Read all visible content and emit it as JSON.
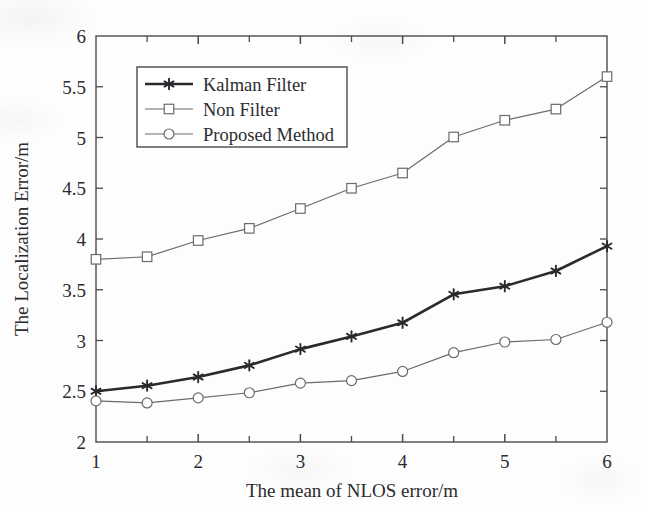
{
  "chart_data": {
    "type": "line",
    "title": "",
    "xlabel": "The mean of NLOS error/m",
    "ylabel": "The Localization Error/m",
    "x": [
      1,
      1.5,
      2,
      2.5,
      3,
      3.5,
      4,
      4.5,
      5,
      5.5,
      6
    ],
    "xlim": [
      1,
      6
    ],
    "ylim": [
      2,
      6
    ],
    "xticks": [
      1,
      2,
      3,
      4,
      5,
      6
    ],
    "xtick_labels": [
      "1",
      "2",
      "3",
      "4",
      "5",
      "6"
    ],
    "xminorticks": [
      1.5,
      2.5,
      3.5,
      4.5,
      5.5
    ],
    "yticks": [
      2,
      2.5,
      3,
      3.5,
      4,
      4.5,
      5,
      5.5,
      6
    ],
    "ytick_labels": [
      "2",
      "2.5",
      "3",
      "3.5",
      "4",
      "4.5",
      "5",
      "5.5",
      "6"
    ],
    "grid": false,
    "legend_position": "upper left",
    "series": [
      {
        "name": "Kalman Filter",
        "marker": "star",
        "color": "#2a2a2e",
        "linewidth": 2.6,
        "values": [
          2.5,
          2.555,
          2.64,
          2.755,
          2.915,
          3.04,
          3.175,
          3.455,
          3.535,
          3.685,
          3.93
        ]
      },
      {
        "name": "Non Filter",
        "marker": "square",
        "color": "#6a6a70",
        "linewidth": 1.2,
        "values": [
          3.8,
          3.825,
          3.985,
          4.105,
          4.3,
          4.5,
          4.65,
          5.005,
          5.17,
          5.28,
          5.6
        ]
      },
      {
        "name": "Proposed Method",
        "marker": "circle",
        "color": "#6a6a70",
        "linewidth": 1.2,
        "values": [
          2.405,
          2.385,
          2.435,
          2.485,
          2.58,
          2.605,
          2.695,
          2.88,
          2.985,
          3.01,
          3.18
        ]
      }
    ]
  },
  "legend": {
    "entries": [
      {
        "label": "Kalman Filter"
      },
      {
        "label": "Non Filter"
      },
      {
        "label": "Proposed Method"
      }
    ]
  },
  "axes": {
    "frame_color": "#4a4a50"
  }
}
